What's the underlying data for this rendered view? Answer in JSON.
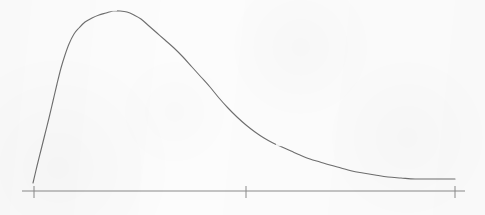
{
  "figure": {
    "title": "",
    "background_color": "#fcfcfc",
    "ink_color": "#6e6e6e",
    "axis_color": "#8a8a8a",
    "width": 485,
    "height": 215
  },
  "chart_data": {
    "type": "line",
    "title": "",
    "subtitle": "",
    "xlabel": "",
    "ylabel": "",
    "legend": [],
    "legend_position": "none",
    "grid": false,
    "axis": {
      "x_axis_line": {
        "x_start": 22,
        "x_end": 465,
        "y": 191
      },
      "y_axis_line": null,
      "tick_marks": [
        {
          "x": 34,
          "label": "",
          "y_top": 186,
          "y_bottom": 198
        },
        {
          "x": 246,
          "label": "",
          "y_top": 186,
          "y_bottom": 198
        },
        {
          "x": 455,
          "label": "",
          "y_top": 186,
          "y_bottom": 198
        }
      ],
      "tick_labels": [],
      "xlim": [
        22,
        465
      ],
      "ylim": [
        0,
        191
      ]
    },
    "series": [
      {
        "name": "distribution-curve",
        "color": "#6e6e6e",
        "line_width": 1.1,
        "points_px": [
          {
            "x": 33,
            "y": 183
          },
          {
            "x": 37,
            "y": 166
          },
          {
            "x": 41,
            "y": 150
          },
          {
            "x": 45,
            "y": 134
          },
          {
            "x": 49,
            "y": 118
          },
          {
            "x": 53,
            "y": 101
          },
          {
            "x": 57,
            "y": 84
          },
          {
            "x": 61,
            "y": 68
          },
          {
            "x": 65,
            "y": 55
          },
          {
            "x": 69,
            "y": 44
          },
          {
            "x": 74,
            "y": 34
          },
          {
            "x": 79,
            "y": 28
          },
          {
            "x": 85,
            "y": 22
          },
          {
            "x": 92,
            "y": 18
          },
          {
            "x": 99,
            "y": 15
          },
          {
            "x": 106,
            "y": 13
          },
          {
            "x": 113,
            "y": 11
          },
          {
            "x": 120,
            "y": 11
          },
          {
            "x": 127,
            "y": 12
          },
          {
            "x": 134,
            "y": 15
          },
          {
            "x": 141,
            "y": 19
          },
          {
            "x": 149,
            "y": 26
          },
          {
            "x": 157,
            "y": 33
          },
          {
            "x": 165,
            "y": 40
          },
          {
            "x": 174,
            "y": 48
          },
          {
            "x": 183,
            "y": 57
          },
          {
            "x": 192,
            "y": 67
          },
          {
            "x": 201,
            "y": 77
          },
          {
            "x": 210,
            "y": 87
          },
          {
            "x": 219,
            "y": 98
          },
          {
            "x": 228,
            "y": 108
          },
          {
            "x": 237,
            "y": 117
          },
          {
            "x": 246,
            "y": 125
          },
          {
            "x": 255,
            "y": 132
          },
          {
            "x": 264,
            "y": 138
          },
          {
            "x": 273,
            "y": 143
          },
          {
            "x": 282,
            "y": 147
          },
          {
            "x": 291,
            "y": 151
          },
          {
            "x": 300,
            "y": 155
          },
          {
            "x": 310,
            "y": 159
          },
          {
            "x": 320,
            "y": 162
          },
          {
            "x": 330,
            "y": 165
          },
          {
            "x": 341,
            "y": 168
          },
          {
            "x": 352,
            "y": 171
          },
          {
            "x": 363,
            "y": 173
          },
          {
            "x": 375,
            "y": 175
          },
          {
            "x": 388,
            "y": 177
          },
          {
            "x": 401,
            "y": 178
          },
          {
            "x": 415,
            "y": 179
          },
          {
            "x": 430,
            "y": 179
          },
          {
            "x": 443,
            "y": 179
          },
          {
            "x": 455,
            "y": 179
          }
        ],
        "peak": {
          "x": 117,
          "y": 11
        },
        "start": {
          "x": 33,
          "y": 183
        },
        "end": {
          "x": 455,
          "y": 179
        },
        "line_breaks": [
          {
            "x_from": 110,
            "x_to": 116,
            "y": 10
          },
          {
            "x_from": 277,
            "x_to": 281,
            "y": 145
          }
        ]
      }
    ]
  }
}
